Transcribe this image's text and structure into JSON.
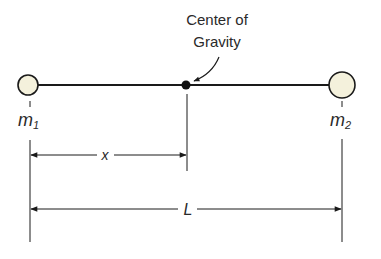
{
  "diagram": {
    "annotation": {
      "line1": "Center of",
      "line2": "Gravity"
    },
    "masses": [
      {
        "label": "m",
        "subscript": "1",
        "size": "small"
      },
      {
        "label": "m",
        "subscript": "2",
        "size": "large"
      }
    ],
    "dimensions": {
      "x_label": "x",
      "L_label": "L"
    },
    "colors": {
      "line": "#1a1a1a",
      "mass_fill": "#f4f1dc",
      "text": "#2a2a2a"
    }
  }
}
